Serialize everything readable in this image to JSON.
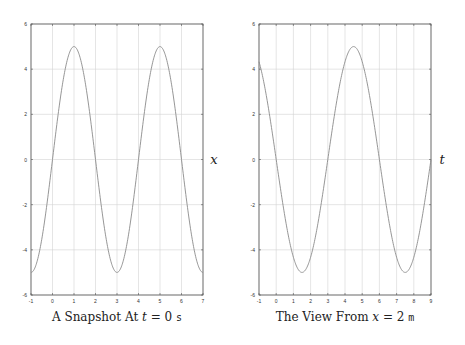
{
  "chart_data": [
    {
      "type": "line",
      "title": "",
      "caption": "A Snapshot At t = 0 s",
      "caption_parts": {
        "prefix": "A Snapshot At ",
        "var": "t",
        "eq": " = 0",
        "unit": "s"
      },
      "xlabel": "x",
      "ylabel": "",
      "xlim": [
        -1,
        7
      ],
      "ylim": [
        -6,
        6
      ],
      "xticks": [
        "-1",
        "0",
        "1",
        "2",
        "3",
        "4",
        "5",
        "6",
        "7"
      ],
      "yticks": [
        "-6",
        "-4",
        "-2",
        "0",
        "2",
        "4",
        "6"
      ],
      "grid": true,
      "legend": null,
      "series": [
        {
          "name": "y(x, t=0)",
          "formula": "5*cos(pi/2*(x-1))",
          "x": [
            -1,
            0,
            1,
            2,
            3,
            4,
            5,
            6,
            7
          ],
          "y": [
            -5,
            0,
            5,
            0,
            -5,
            0,
            5,
            0,
            -5
          ]
        }
      ]
    },
    {
      "type": "line",
      "title": "",
      "caption": "The View From x = 2 m",
      "caption_parts": {
        "prefix": "The View From ",
        "var": "x",
        "eq": " = 2",
        "unit": "m"
      },
      "xlabel": "t",
      "ylabel": "",
      "xlim": [
        -1,
        9
      ],
      "ylim": [
        -6,
        6
      ],
      "xticks": [
        "-1",
        "0",
        "1",
        "2",
        "3",
        "4",
        "5",
        "6",
        "7",
        "8",
        "9"
      ],
      "yticks": [
        "-6",
        "-4",
        "-2",
        "0",
        "2",
        "4",
        "6"
      ],
      "grid": true,
      "legend": null,
      "series": [
        {
          "name": "y(x=2, t)",
          "formula": "5*cos(pi/3*(t-4.5))",
          "x": [
            -1,
            0,
            1.5,
            3,
            4.5,
            6,
            7.5,
            9
          ],
          "y": [
            4.33,
            2.5,
            -5,
            0,
            5,
            0,
            -5,
            0
          ]
        }
      ]
    }
  ]
}
